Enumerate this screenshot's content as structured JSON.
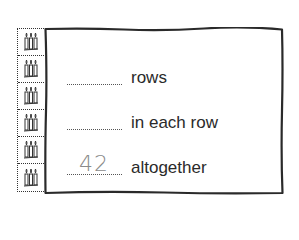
{
  "picture": {
    "rows": 6,
    "items_per_row": 3,
    "item_icon": "candle-icon"
  },
  "worksheet": {
    "lines": [
      {
        "answer": "",
        "label": "rows"
      },
      {
        "answer": "",
        "label": "in each row"
      },
      {
        "answer": "42",
        "label": "altogether"
      }
    ]
  },
  "colors": {
    "border": "#2a2a2a",
    "text": "#2a2a2a",
    "answer": "#8a8a8a"
  }
}
